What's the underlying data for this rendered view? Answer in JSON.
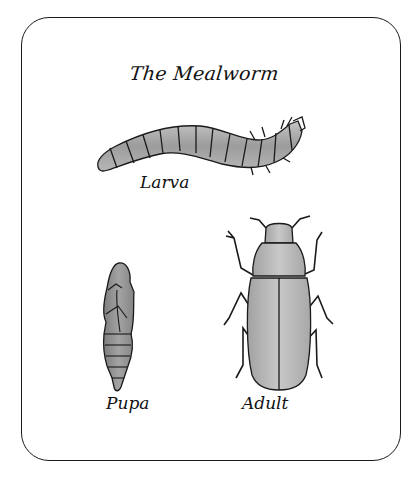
{
  "title": "The Mealworm",
  "stages": [
    {
      "id": "larva",
      "label": "Larva"
    },
    {
      "id": "pupa",
      "label": "Pupa"
    },
    {
      "id": "adult",
      "label": "Adult"
    }
  ],
  "colors": {
    "outline": "#1a1a1a",
    "body_fill": "#a9a9a9",
    "pupa_fill": "#8f8f8f",
    "adult_fill": "#b5b5b5",
    "background": "#ffffff"
  }
}
